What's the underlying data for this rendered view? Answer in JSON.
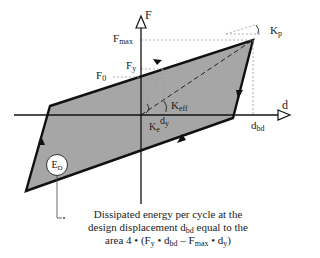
{
  "diagram": {
    "type": "bilinear hysteresis loop (force-displacement)",
    "axes": {
      "x_label": "d",
      "y_label": "F"
    },
    "force_labels": {
      "f_max": {
        "base": "F",
        "sub": "max"
      },
      "f_y": {
        "base": "F",
        "sub": "y"
      },
      "f_0": {
        "base": "F",
        "sub": "0"
      }
    },
    "displacement_labels": {
      "d_bd": {
        "base": "d",
        "sub": "bd"
      },
      "d_y": {
        "base": "d",
        "sub": "y"
      }
    },
    "stiffness_labels": {
      "k_p": {
        "base": "K",
        "sub": "p"
      },
      "k_eff": {
        "base": "K",
        "sub": "eff"
      },
      "k_e": {
        "base": "K",
        "sub": "e"
      }
    },
    "energy_label": {
      "base": "E",
      "sub": "D"
    },
    "caption": {
      "line1": "Dissipated energy per cycle at the",
      "line2_pre": "design displacement d",
      "line2_sub": "bd",
      "line2_post": " equal to the",
      "line3_pre": "area 4 • (F",
      "line3_sub1": "y",
      "line3_mid1": " • d",
      "line3_sub2": "bd",
      "line3_mid2": " – F",
      "line3_sub3": "max",
      "line3_mid3": " • d",
      "line3_sub4": "y",
      "line3_post": ")"
    },
    "colors": {
      "loop_fill": "#a6a6a6",
      "loop_stroke": "#111111",
      "guide_dotted": "#9a9a9a"
    }
  }
}
